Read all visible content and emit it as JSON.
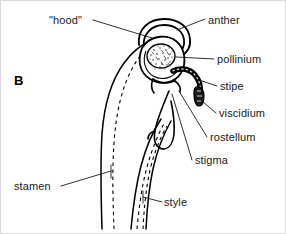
{
  "figure": {
    "panel_letter": "B",
    "background_color": "#ffffff",
    "ink_color": "#000000",
    "border_color": "#d9d9d9",
    "width": 286,
    "height": 234
  },
  "labels": [
    {
      "id": "hood",
      "text": "\"hood\"",
      "x": 48,
      "y": 13,
      "align": "left"
    },
    {
      "id": "anther",
      "text": "anther",
      "x": 207,
      "y": 13,
      "align": "left"
    },
    {
      "id": "pollinium",
      "text": "pollinium",
      "x": 216,
      "y": 55,
      "align": "left"
    },
    {
      "id": "stipe",
      "text": "stipe",
      "x": 219,
      "y": 83,
      "align": "left"
    },
    {
      "id": "viscidium",
      "text": "viscidium",
      "x": 218,
      "y": 110,
      "align": "left"
    },
    {
      "id": "rostellum",
      "text": "rostellum",
      "x": 209,
      "y": 134,
      "align": "left"
    },
    {
      "id": "stigma",
      "text": "stigma",
      "x": 194,
      "y": 157,
      "align": "left"
    },
    {
      "id": "stamen",
      "text": "stamen",
      "x": 13,
      "y": 182,
      "align": "left"
    },
    {
      "id": "style",
      "text": "style",
      "x": 163,
      "y": 199,
      "align": "left"
    }
  ],
  "structures": [
    {
      "id": "hood",
      "name": "hood-crescent"
    },
    {
      "id": "anther",
      "name": "anther-sac"
    },
    {
      "id": "pollinium",
      "name": "pollinium-stippled-mass"
    },
    {
      "id": "stipe",
      "name": "stipe-stalk"
    },
    {
      "id": "viscidium",
      "name": "viscidium-pad"
    },
    {
      "id": "rostellum",
      "name": "rostellum-flap"
    },
    {
      "id": "stigma",
      "name": "stigma-lobe"
    },
    {
      "id": "stamen",
      "name": "stamen-column"
    },
    {
      "id": "style",
      "name": "style-shaft"
    }
  ]
}
